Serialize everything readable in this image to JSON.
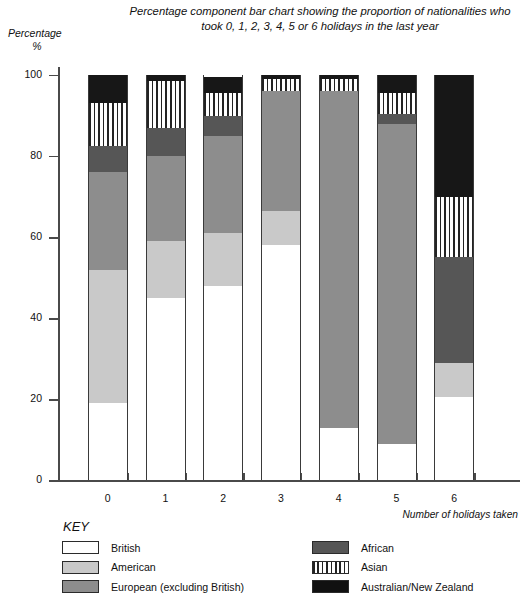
{
  "chart_data": {
    "type": "bar",
    "subtype": "percentage-component-stacked",
    "title": "Percentage component bar chart showing the proportion of nationalities who took 0, 1, 2, 3, 4, 5 or 6 holidays in the last year",
    "ylabel": "Percentage\n%",
    "ylabel_line1": "Percentage",
    "ylabel_line2": "%",
    "xlabel": "Number of holidays taken",
    "categories": [
      "0",
      "1",
      "2",
      "3",
      "4",
      "5",
      "6"
    ],
    "ylim": [
      0,
      100
    ],
    "yticks": [
      0,
      20,
      40,
      60,
      80,
      100
    ],
    "ytick_labels": [
      "0",
      "20",
      "40",
      "60",
      "80",
      "100"
    ],
    "grid": false,
    "legend_position": "below-plot",
    "series": [
      {
        "name": "British",
        "color": "#ffffff",
        "fill": "solid",
        "values": [
          19,
          45,
          48,
          58,
          13,
          9,
          20.5
        ]
      },
      {
        "name": "American",
        "color": "#c9c9c9",
        "fill": "solid",
        "values": [
          33,
          14,
          13,
          8.5,
          0,
          0,
          8.5
        ]
      },
      {
        "name": "European (excluding British)",
        "color": "#8d8d8d",
        "fill": "solid",
        "values": [
          24,
          21,
          24,
          29.5,
          83,
          79,
          0
        ]
      },
      {
        "name": "African",
        "color": "#565656",
        "fill": "solid",
        "values": [
          6.5,
          7,
          5,
          0,
          0,
          2.5,
          26
        ]
      },
      {
        "name": "Asian",
        "color": "#ffffff",
        "fill": "vertical-stripes",
        "values": [
          10.5,
          11.5,
          5.5,
          3,
          3,
          5,
          15
        ]
      },
      {
        "name": "Australian/New Zealand",
        "color": "#171717",
        "fill": "solid",
        "values": [
          7,
          1.5,
          4,
          1,
          1,
          4.5,
          30
        ]
      }
    ],
    "stack_tops": {
      "0": [
        19,
        52,
        76,
        82.5,
        93,
        100
      ],
      "1": [
        45,
        59,
        80,
        87,
        98.5,
        100
      ],
      "2": [
        48,
        61,
        85,
        90,
        95.5,
        100
      ],
      "3": [
        58,
        66.5,
        96,
        96,
        99,
        100
      ],
      "4": [
        13,
        13,
        96,
        96,
        99,
        100
      ],
      "5": [
        9,
        9,
        88,
        90.5,
        95.5,
        100
      ],
      "6": [
        20.5,
        29,
        29,
        55,
        70,
        100
      ]
    }
  },
  "key": {
    "heading": "KEY",
    "left_items": [
      {
        "label": "British",
        "swatch": "sw-british"
      },
      {
        "label": "American",
        "swatch": "sw-american"
      },
      {
        "label": "European (excluding British)",
        "swatch": "sw-european"
      }
    ],
    "right_items": [
      {
        "label": "African",
        "swatch": "sw-african"
      },
      {
        "label": "Asian",
        "swatch": "sw-asian"
      },
      {
        "label": "Australian/New Zealand",
        "swatch": "sw-ausnz"
      }
    ]
  }
}
